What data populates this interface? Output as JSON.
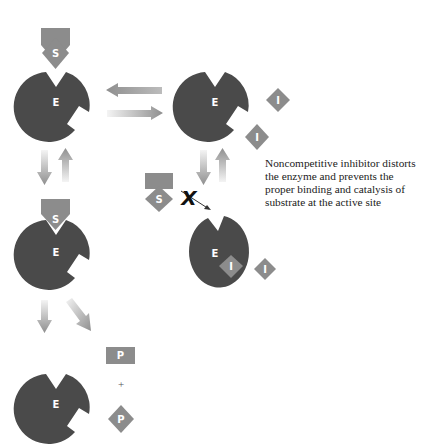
{
  "colors": {
    "enzyme": "#4a4a4a",
    "substrate": "#8c8c8c",
    "inhibitor": "#8c8c8c",
    "arrow": "#8f8f8f",
    "background": "#ffffff"
  },
  "labels": {
    "enzyme": "E",
    "substrate": "S",
    "inhibitor": "I",
    "product": "P",
    "plus": "+",
    "blocked": "X"
  },
  "caption": {
    "lines": [
      "Noncompetitive inhibitor distorts",
      "the enzyme and prevents the",
      "proper binding and catalysis of",
      "substrate at the active site"
    ]
  }
}
